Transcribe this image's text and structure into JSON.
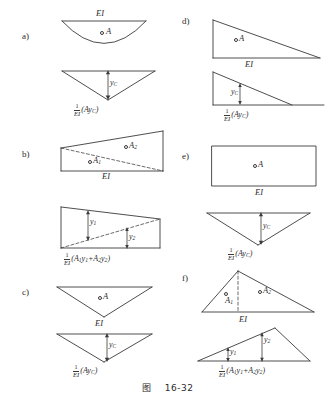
{
  "figure": {
    "caption_prefix": "图",
    "caption_number": "16-32",
    "caption_full": "图  16-32",
    "ei_label": "EI",
    "stroke_color": "#3a3a3a",
    "background": "#ffffff"
  },
  "panels": [
    {
      "id": "a",
      "letter": "a)",
      "upper_shape": "parabolic-segment",
      "upper_area_label": "A",
      "upper_base_label": "EI",
      "lower_shape": "inverted-triangle",
      "ordinate_label": "y",
      "ordinate_sub": "C",
      "formula_numerator": "1",
      "formula_denominator": "EI",
      "formula_expression": "(Ay",
      "formula_expression_sub": "C",
      "formula_expression_tail": ")",
      "formula_plain": "1/EI (Ay_C)"
    },
    {
      "id": "b",
      "letter": "b)",
      "upper_shape": "trapezoid-rising",
      "upper_area_label_1": "A",
      "upper_area_sub_1": "1",
      "upper_area_label_2": "A",
      "upper_area_sub_2": "2",
      "upper_base_label": "EI",
      "lower_shape": "trapezoid-falling",
      "ordinate_label_1": "y",
      "ordinate_sub_1": "1",
      "ordinate_label_2": "y",
      "ordinate_sub_2": "2",
      "formula_numerator": "1",
      "formula_denominator": "EI",
      "formula_plain": "1/EI (A1y1 + A2y2)"
    },
    {
      "id": "c",
      "letter": "c)",
      "upper_shape": "inverted-triangle",
      "upper_area_label": "A",
      "upper_base_label": "EI",
      "lower_shape": "inverted-triangle",
      "ordinate_label": "y",
      "ordinate_sub": "C",
      "formula_numerator": "1",
      "formula_denominator": "EI",
      "formula_plain": "1/EI (Ay_C)"
    },
    {
      "id": "d",
      "letter": "d)",
      "upper_shape": "right-triangle",
      "upper_area_label": "A",
      "upper_base_label": "EI",
      "lower_shape": "right-triangle-with-extension",
      "ordinate_label": "y",
      "ordinate_sub": "C",
      "formula_numerator": "1",
      "formula_denominator": "EI",
      "formula_plain": "1/EI (Ay_C)"
    },
    {
      "id": "e",
      "letter": "e)",
      "upper_shape": "rectangle",
      "upper_area_label": "A",
      "upper_base_label": "EI",
      "lower_shape": "inverted-triangle",
      "ordinate_label": "y",
      "ordinate_sub": "C",
      "formula_numerator": "1",
      "formula_denominator": "EI",
      "formula_plain": "1/EI (Ay_C)"
    },
    {
      "id": "f",
      "letter": "f)",
      "upper_shape": "triangle-split",
      "upper_area_label_1": "A",
      "upper_area_sub_1": "1",
      "upper_area_label_2": "A",
      "upper_area_sub_2": "2",
      "upper_base_label": "EI",
      "lower_shape": "triangle-rising",
      "ordinate_label_1": "y",
      "ordinate_sub_1": "1",
      "ordinate_label_2": "y",
      "ordinate_sub_2": "2",
      "formula_numerator": "1",
      "formula_denominator": "EI",
      "formula_plain": "1/EI (A1y1 + A2y2)"
    }
  ],
  "formulas": {
    "single": {
      "numerator": "1",
      "denominator": "EI",
      "open": "(A",
      "y": "y",
      "y_sub": "C",
      "close": ")"
    },
    "double": {
      "numerator": "1",
      "denominator": "EI",
      "open": "(A",
      "a1_sub": "1",
      "y1": "y",
      "y1_sub": "1",
      "plus": "+A",
      "a2_sub": "2",
      "y2": "y",
      "y2_sub": "2",
      "close": ")"
    }
  }
}
